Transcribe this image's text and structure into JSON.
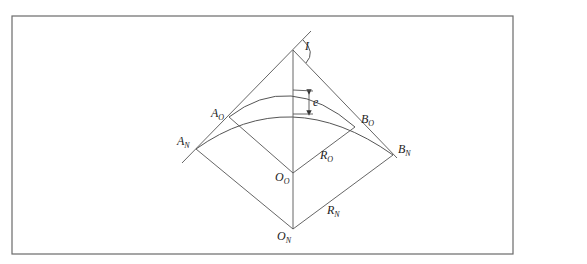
{
  "figure": {
    "type": "curve-shift geometry diagram",
    "frame": {
      "x": 12,
      "y": 16,
      "width": 501,
      "height": 238
    },
    "colors": {
      "line": "#555555",
      "frame": "#6a6a6a",
      "text": "#222222",
      "background": "#ffffff"
    }
  },
  "labels": {
    "intersection_angle": {
      "main": "I",
      "sub": ""
    },
    "a_old": {
      "main": "A",
      "sub": "O"
    },
    "a_new": {
      "main": "A",
      "sub": "N"
    },
    "b_old": {
      "main": "B",
      "sub": "O"
    },
    "b_new": {
      "main": "B",
      "sub": "N"
    },
    "o_old": {
      "main": "O",
      "sub": "O"
    },
    "o_new": {
      "main": "O",
      "sub": "N"
    },
    "r_old": {
      "main": "R",
      "sub": "O"
    },
    "r_new": {
      "main": "R",
      "sub": "N"
    },
    "shift": {
      "main": "e",
      "sub": ""
    }
  },
  "points": {
    "PI": [
      293,
      50
    ],
    "A_O": [
      229,
      117
    ],
    "A_N": [
      196,
      149
    ],
    "B_O": [
      355,
      127
    ],
    "B_N": [
      393,
      155
    ],
    "O_O": [
      293,
      173
    ],
    "O_N": [
      293,
      229
    ],
    "arc_old_top": [
      293,
      90
    ],
    "arc_new_top": [
      293,
      114
    ]
  }
}
